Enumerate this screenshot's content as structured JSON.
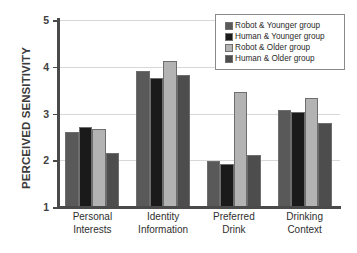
{
  "chart_data": {
    "type": "bar",
    "title": "",
    "xlabel": "",
    "ylabel": "PERCEIVED SENSITIVITY",
    "ylim": [
      1,
      5
    ],
    "yticks": [
      1,
      2,
      3,
      4,
      5
    ],
    "ytick_labels": [
      "1",
      "2",
      "3",
      "4",
      "5"
    ],
    "grid": true,
    "legend_position": "top-right",
    "categories": [
      "Personal Interests",
      "Identity Information",
      "Preferred Drink",
      "Drinking Context"
    ],
    "category_lines": [
      [
        "Personal",
        "Interests"
      ],
      [
        "Identity",
        "Information"
      ],
      [
        "Preferred",
        "Drink"
      ],
      [
        "Drinking",
        "Context"
      ]
    ],
    "series": [
      {
        "name": "Robot & Younger group",
        "color": "#595959",
        "values": [
          2.6,
          3.92,
          1.99,
          3.08
        ]
      },
      {
        "name": "Human & Younger group",
        "color": "#1a1a1a",
        "values": [
          2.72,
          3.75,
          1.92,
          3.03
        ]
      },
      {
        "name": "Robot & Older group",
        "color": "#b3b3b3",
        "values": [
          2.67,
          4.12,
          3.47,
          3.34
        ]
      },
      {
        "name": "Human & Older group",
        "color": "#4d4d4d",
        "values": [
          2.15,
          3.83,
          2.11,
          2.8
        ]
      }
    ]
  },
  "legend": {
    "items": [
      {
        "label": "Robot & Younger group",
        "color": "#595959"
      },
      {
        "label": "Human & Younger group",
        "color": "#1a1a1a"
      },
      {
        "label": "Robot & Older group",
        "color": "#b3b3b3"
      },
      {
        "label": "Human & Older group",
        "color": "#4d4d4d"
      }
    ]
  }
}
